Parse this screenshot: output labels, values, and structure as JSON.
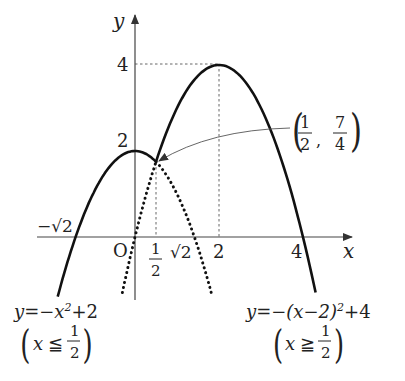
{
  "diagram": {
    "type": "function-graph",
    "axes": {
      "x_label": "x",
      "y_label": "y",
      "origin_label": "O"
    },
    "x_ticks": [
      {
        "id": "neg_sqrt2",
        "label": "−√2",
        "value": -1.414
      },
      {
        "id": "half",
        "label_num": "1",
        "label_den": "2",
        "value": 0.5
      },
      {
        "id": "sqrt2",
        "label": "√2",
        "value": 1.414
      },
      {
        "id": "two",
        "label": "2",
        "value": 2
      },
      {
        "id": "four",
        "label": "4",
        "value": 4
      }
    ],
    "y_ticks": [
      {
        "id": "two",
        "label": "2",
        "value": 2
      },
      {
        "id": "four",
        "label": "4",
        "value": 4
      }
    ],
    "point_annotation": {
      "label_x_num": "1",
      "label_x_den": "2",
      "label_y_num": "7",
      "label_y_den": "4",
      "separator": ",",
      "x": 0.5,
      "y": 1.75
    },
    "curves": [
      {
        "name": "left-parabola",
        "equation": "y=−x²+2",
        "equation_parts": {
          "lhs": "y=−x",
          "exp": "2",
          "rhs": "+2"
        },
        "domain_text": {
          "var": "x",
          "rel": "≦",
          "num": "1",
          "den": "2"
        },
        "solid_domain": "x ≤ 1/2",
        "vertex": [
          0,
          2
        ]
      },
      {
        "name": "right-parabola",
        "equation": "y=−(x−2)²+4",
        "equation_parts": {
          "lhs": "y=−(x−2)",
          "exp": "2",
          "rhs": "+4"
        },
        "domain_text": {
          "var": "x",
          "rel": "≧",
          "num": "1",
          "den": "2"
        },
        "solid_domain": "x ≥ 1/2",
        "vertex": [
          2,
          4
        ]
      }
    ]
  }
}
